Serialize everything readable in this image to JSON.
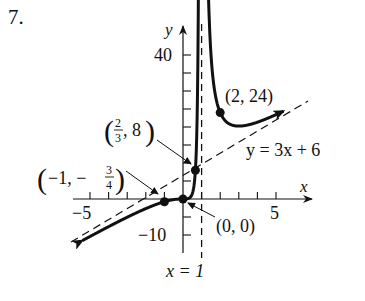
{
  "problem_number": "7.",
  "chart_data": {
    "type": "line",
    "title": "",
    "function": "f(x) = 3x^3 / (x - 1)^2",
    "xlabel": "x",
    "ylabel": "y",
    "xlim": [
      -6,
      7
    ],
    "ylim": [
      -12,
      42
    ],
    "grid": false,
    "x_ticks": [
      -5,
      -4,
      -3,
      -2,
      -1,
      0,
      1,
      2,
      3,
      4,
      5
    ],
    "x_tick_labels": [
      {
        "value": -5,
        "label": "−5"
      },
      {
        "value": 5,
        "label": "5"
      }
    ],
    "y_ticks": [
      -10,
      -5,
      0,
      5,
      10,
      15,
      20,
      25,
      30,
      35,
      40
    ],
    "y_tick_labels": [
      {
        "value": 40,
        "label": "40"
      },
      {
        "value": -10,
        "label": "−10"
      }
    ],
    "asymptotes": [
      {
        "type": "vertical",
        "equation": "x = 1",
        "label": "x = 1"
      },
      {
        "type": "oblique",
        "equation": "y = 3x + 6",
        "label": "y = 3x + 6"
      }
    ],
    "points": [
      {
        "x": 2,
        "y": 24,
        "label": "(2, 24)"
      },
      {
        "x": 0.6667,
        "y": 8,
        "label": "(2/3, 8)"
      },
      {
        "x": -1,
        "y": -0.75,
        "label": "(−1, −3/4)"
      },
      {
        "x": 0,
        "y": 0,
        "label": "(0, 0)"
      }
    ],
    "series": [
      {
        "name": "left branch (x < 1)",
        "x_range": [
          -5.4,
          0.97
        ]
      },
      {
        "name": "right branch (x > 1)",
        "x_range": [
          1.18,
          5.4
        ]
      }
    ]
  },
  "labels": {
    "x_axis": "x",
    "y_axis": "y",
    "tick_neg5": "−5",
    "tick_5": "5",
    "tick_40": "40",
    "tick_neg10": "−10",
    "vertical_asymptote": "x = 1",
    "oblique_asymptote": "y = 3x + 6",
    "point_2_24": "(2, 24)",
    "point_0_0": "(0, 0)",
    "point_23_8_open": "(",
    "point_23_8_num": "2",
    "point_23_8_den": "3",
    "point_23_8_rest": ", 8",
    "point_23_8_close": ")",
    "point_neg1_open": "(",
    "point_neg1_main": "−1, −",
    "point_neg1_num": "3",
    "point_neg1_den": "4",
    "point_neg1_close": ")"
  }
}
